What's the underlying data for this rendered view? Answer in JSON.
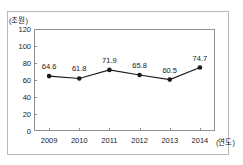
{
  "title_remnant": "",
  "axes": {
    "y_unit_label": "(조원)",
    "x_unit_label": "(연도)",
    "y_ticks": [
      0,
      20,
      40,
      60,
      80,
      100,
      120
    ]
  },
  "chart_data": {
    "type": "line",
    "title": "",
    "xlabel": "(연도)",
    "ylabel": "(조원)",
    "categories": [
      "2009",
      "2010",
      "2011",
      "2012",
      "2013",
      "2014"
    ],
    "values": [
      64.6,
      61.8,
      71.9,
      65.8,
      60.5,
      74.7
    ],
    "value_labels": [
      "64.6",
      "61.8",
      "71.9",
      "65.8",
      "60.5",
      "74.7"
    ],
    "ylim": [
      0,
      120
    ],
    "ytick_step": 20,
    "ytick_labels": [
      "0",
      "20",
      "40",
      "60",
      "80",
      "100",
      "120"
    ],
    "grid": false,
    "legend": false,
    "marker": "filled-circle",
    "line_color": "#1a1a1a",
    "marker_color": "#1a1a1a"
  }
}
